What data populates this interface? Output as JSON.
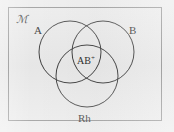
{
  "figure": {
    "type": "venn-diagram",
    "background_color": "#eaeaea",
    "frame_color": "#8d8d8d",
    "stroke_color": "#3a3a3a",
    "text_color": "#2c2c2c"
  },
  "labels": {
    "universe": "ℳ",
    "universe_name": "universal-set",
    "set_a": "A",
    "set_b": "B",
    "set_rh": "Rh",
    "intersection": "AB",
    "intersection_superscript": "+"
  },
  "circles": [
    {
      "name": "circle-a",
      "label": "A",
      "cx": 70,
      "cy": 52,
      "r": 31
    },
    {
      "name": "circle-b",
      "label": "B",
      "cx": 103,
      "cy": 52,
      "r": 31
    },
    {
      "name": "circle-rh",
      "label": "Rh",
      "cx": 87,
      "cy": 76,
      "r": 31
    }
  ]
}
